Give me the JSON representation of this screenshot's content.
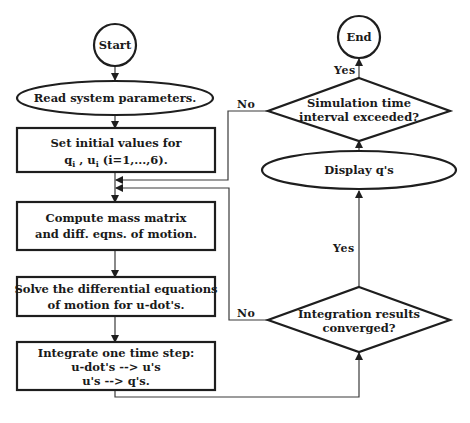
{
  "diagram": {
    "type": "flowchart",
    "nodes": {
      "start": {
        "shape": "circle",
        "label": "Start"
      },
      "read": {
        "shape": "ellipse",
        "label": "Read system parameters."
      },
      "set_initial": {
        "shape": "rect",
        "line1": "Set initial values for",
        "line2_q": "q",
        "line2_sub_i1": "i",
        "line2_sep": " ,  u",
        "line2_sub_i2": "i",
        "line2_range": "(i=1,...,6)."
      },
      "compute": {
        "shape": "rect",
        "line1": "Compute mass matrix",
        "line2": "and diff. eqns. of motion."
      },
      "solve": {
        "shape": "rect",
        "line1": "Solve the differential equations",
        "line2": "of motion for u-dot's."
      },
      "integrate": {
        "shape": "rect",
        "line1": "Integrate one time step:",
        "line2": "u-dot's --> u's",
        "line3": "u's --> q's."
      },
      "converged": {
        "shape": "diamond",
        "line1": "Integration results",
        "line2": "converged?"
      },
      "display": {
        "shape": "ellipse",
        "label": "Display q's"
      },
      "time_check": {
        "shape": "diamond",
        "line1": "Simulation time",
        "line2": "interval exceeded?"
      },
      "end": {
        "shape": "circle",
        "label": "End"
      }
    },
    "edge_labels": {
      "time_check_yes": "Yes",
      "time_check_no": "No",
      "converged_yes": "Yes",
      "converged_no": "No"
    },
    "edges": [
      {
        "from": "start",
        "to": "read"
      },
      {
        "from": "read",
        "to": "set_initial"
      },
      {
        "from": "set_initial",
        "to": "compute"
      },
      {
        "from": "compute",
        "to": "solve"
      },
      {
        "from": "solve",
        "to": "integrate"
      },
      {
        "from": "integrate",
        "to": "converged"
      },
      {
        "from": "converged",
        "to": "display",
        "label": "Yes"
      },
      {
        "from": "converged",
        "to": "compute",
        "label": "No"
      },
      {
        "from": "display",
        "to": "time_check"
      },
      {
        "from": "time_check",
        "to": "end",
        "label": "Yes"
      },
      {
        "from": "time_check",
        "to": "compute",
        "label": "No"
      }
    ],
    "colors": {
      "stroke": "#1e1e1e",
      "text": "#1a1a1a",
      "background": "#ffffff"
    }
  }
}
